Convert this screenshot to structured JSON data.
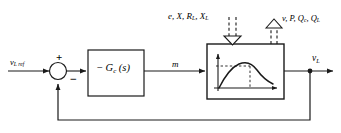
{
  "diagram": {
    "stroke_color": "#1a1a1a",
    "background_color": "#ffffff",
    "labels": {
      "reference_input": "v",
      "reference_input_sub": "L ref",
      "manipulated_variable": "m",
      "output": "v",
      "output_sub": "L",
      "sum_plus": "+",
      "sum_minus": "−",
      "controller_minus": "−",
      "controller_name": "G",
      "controller_sub": "c",
      "controller_arg": "(s)",
      "disturbance_in": "e, X, R",
      "disturbance_in_sub1": "L",
      "disturbance_in_2": ", X",
      "disturbance_in_sub2": "L",
      "disturbance_out": "v, P, Q",
      "disturbance_out_sub1": "c",
      "disturbance_out_2": ", Q",
      "disturbance_out_sub2": "L"
    },
    "blocks": [
      {
        "name": "controller-block",
        "label": "− G c (s)"
      },
      {
        "name": "plant-block",
        "label": "nonlinear plant characteristic"
      }
    ],
    "plant_curve": {
      "type": "line",
      "description": "nonlinear rise-and-fall characteristic with marked operating point",
      "x": [
        0,
        0.08,
        0.18,
        0.3,
        0.42,
        0.52,
        0.62,
        0.74,
        0.86,
        1.0
      ],
      "y": [
        0.0,
        0.3,
        0.56,
        0.76,
        0.88,
        0.92,
        0.86,
        0.68,
        0.5,
        0.38
      ],
      "marker_x": 0.52,
      "marker_y": 0.92,
      "xlabel": "",
      "ylabel": "",
      "grid": false
    }
  }
}
